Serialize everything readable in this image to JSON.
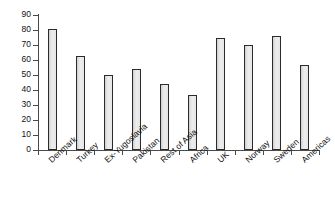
{
  "chart_data": {
    "type": "bar",
    "title": "",
    "subtitle": "",
    "xlabel": "",
    "ylabel": "",
    "categories": [
      "Denmark",
      "Turkey",
      "Ex-Yugoslavia",
      "Pakistan",
      "Rest of Asia",
      "Africa",
      "UK",
      "Norway",
      "Sweden",
      "Americas"
    ],
    "values": [
      81,
      63,
      50,
      54,
      44,
      37,
      75,
      70,
      76,
      57
    ],
    "ylim": [
      0,
      90
    ],
    "ytick_labels": [
      "0",
      "10",
      "20",
      "30",
      "40",
      "50",
      "60",
      "70",
      "80",
      "90"
    ],
    "ytick_values": [
      0,
      10,
      20,
      30,
      40,
      50,
      60,
      70,
      80,
      90
    ],
    "grid": false,
    "legend": null,
    "legend_position": "none",
    "series": [
      {
        "name": "",
        "values": [
          81,
          63,
          50,
          54,
          44,
          37,
          75,
          70,
          76,
          57
        ]
      }
    ],
    "annotations": [],
    "colors": {
      "bar_fill": "#e3e3e3",
      "bar_border": "#2b2b2b",
      "axis": "#4a4a4a",
      "text": "#111111",
      "background": "#ffffff"
    }
  }
}
